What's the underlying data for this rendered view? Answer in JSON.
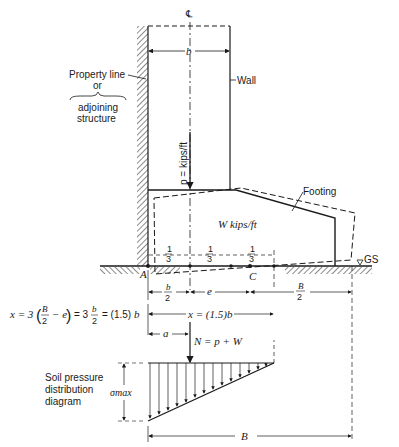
{
  "diagram": {
    "centerline_symbol": "℄",
    "labels": {
      "wall_width": "b",
      "wall": "Wall",
      "property_line": "Property line",
      "or": "or",
      "adjoining_line1": "adjoining",
      "adjoining_line2": "structure",
      "load": "p = kips/ft",
      "footing": "Footing",
      "footing_weight": "W kips/ft",
      "point_a": "A",
      "point_c": "C",
      "ground_surface": "GS",
      "third": "1",
      "third_den": "3",
      "half_b_num": "b",
      "half_b_den": "2",
      "eccentricity": "e",
      "half_B_num": "B",
      "half_B_den": "2",
      "x_equation": "x = 3(B/2 − e) = 3 b/2 = (1.5) b",
      "x_eq_part1": "x = 3",
      "x_eq_B": "B",
      "x_eq_2": "2",
      "x_eq_minus_e": "− e",
      "x_eq_part2": "= 3",
      "x_eq_b": "b",
      "x_eq_part3": "= (1.5)",
      "x_eq_b_end": "b",
      "x_dim": "x = (1.5)b",
      "a_dim": "a",
      "resultant": "N = p + W",
      "soil_line1": "Soil pressure",
      "soil_line2": "distribution",
      "soil_line3": "diagram",
      "sigma_max": "σmax",
      "base_width": "B"
    },
    "colors": {
      "line": "#1a1a1a",
      "background": "#ffffff"
    }
  }
}
